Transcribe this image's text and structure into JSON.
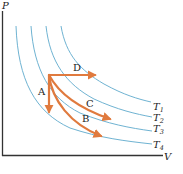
{
  "diagram": {
    "type": "PV diagram with isotherms",
    "axes": {
      "y_label": "P",
      "x_label": "V"
    },
    "isotherms": [
      {
        "label": "T",
        "sub": "1"
      },
      {
        "label": "T",
        "sub": "2"
      },
      {
        "label": "T",
        "sub": "3"
      },
      {
        "label": "T",
        "sub": "4"
      }
    ],
    "processes": [
      {
        "label": "A"
      },
      {
        "label": "B"
      },
      {
        "label": "C"
      },
      {
        "label": "D"
      }
    ],
    "colors": {
      "isotherm": "#6fb3d2",
      "process": "#e07a3e",
      "axis": "#333333"
    }
  }
}
